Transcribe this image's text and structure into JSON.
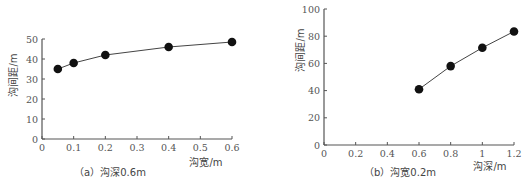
{
  "chart_data": [
    {
      "type": "line",
      "caption": "（a）沟深0.6m",
      "xlabel": "沟宽/m",
      "ylabel": "沟间距/m",
      "xlim": [
        0,
        0.6
      ],
      "ylim": [
        0,
        50
      ],
      "xticks": [
        "0",
        "0.1",
        "0.2",
        "0.3",
        "0.4",
        "0.5",
        "0.6"
      ],
      "yticks": [
        "0",
        "10",
        "20",
        "30",
        "40",
        "50"
      ],
      "grid": false,
      "markers": "filled-circle",
      "x": [
        0.05,
        0.1,
        0.2,
        0.4,
        0.6
      ],
      "y": [
        35,
        38,
        42,
        46,
        48.5
      ]
    },
    {
      "type": "line",
      "caption": "（b）沟宽0.2m",
      "xlabel": "沟深/m",
      "ylabel": "沟间距/m",
      "xlim": [
        0,
        1.2
      ],
      "ylim": [
        0,
        100
      ],
      "xticks": [
        "0",
        "0.2",
        "0.4",
        "0.6",
        "0.8",
        "1",
        "1.2"
      ],
      "yticks": [
        "0",
        "20",
        "40",
        "60",
        "80",
        "100"
      ],
      "grid": false,
      "markers": "filled-circle",
      "x": [
        0.6,
        0.8,
        1.0,
        1.2
      ],
      "y": [
        41,
        58,
        71.5,
        83.5
      ]
    }
  ]
}
